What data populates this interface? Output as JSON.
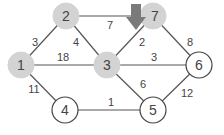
{
  "diagram": {
    "type": "weighted-graph",
    "colors": {
      "visited_fill": "#d3d3d3",
      "unvisited_fill": "#ffffff",
      "unvisited_stroke": "#444444",
      "edge": "#555555",
      "arrow": "#7a7a7a",
      "text": "#444444"
    },
    "nodes": [
      {
        "id": "1",
        "label": "1",
        "x": 21,
        "y": 65,
        "filled": true
      },
      {
        "id": "2",
        "label": "2",
        "x": 66,
        "y": 16,
        "filled": true
      },
      {
        "id": "3",
        "label": "3",
        "x": 107,
        "y": 65,
        "filled": true
      },
      {
        "id": "7",
        "label": "7",
        "x": 153,
        "y": 16,
        "filled": true
      },
      {
        "id": "6",
        "label": "6",
        "x": 199,
        "y": 65,
        "filled": false
      },
      {
        "id": "4",
        "label": "4",
        "x": 65,
        "y": 110,
        "filled": false
      },
      {
        "id": "5",
        "label": "5",
        "x": 153,
        "y": 110,
        "filled": false
      }
    ],
    "edges": [
      {
        "from": "1",
        "to": "2",
        "weight": "3",
        "lx": 35,
        "ly": 42
      },
      {
        "from": "2",
        "to": "3",
        "weight": "4",
        "lx": 76,
        "ly": 42
      },
      {
        "from": "1",
        "to": "3",
        "weight": "18",
        "lx": 63,
        "ly": 57
      },
      {
        "from": "2",
        "to": "7",
        "weight": "7",
        "lx": 110,
        "ly": 25
      },
      {
        "from": "3",
        "to": "7",
        "weight": "2",
        "lx": 142,
        "ly": 42
      },
      {
        "from": "7",
        "to": "6",
        "weight": "8",
        "lx": 190,
        "ly": 42
      },
      {
        "from": "3",
        "to": "6",
        "weight": "3",
        "lx": 154,
        "ly": 57
      },
      {
        "from": "3",
        "to": "5",
        "weight": "6",
        "lx": 143,
        "ly": 84
      },
      {
        "from": "1",
        "to": "4",
        "weight": "11",
        "lx": 34,
        "ly": 89
      },
      {
        "from": "4",
        "to": "5",
        "weight": "1",
        "lx": 111,
        "ly": 102
      },
      {
        "from": "5",
        "to": "6",
        "weight": "12",
        "lx": 187,
        "ly": 93
      }
    ],
    "pointer": {
      "target": "7",
      "icon": "down-arrow-icon"
    }
  }
}
